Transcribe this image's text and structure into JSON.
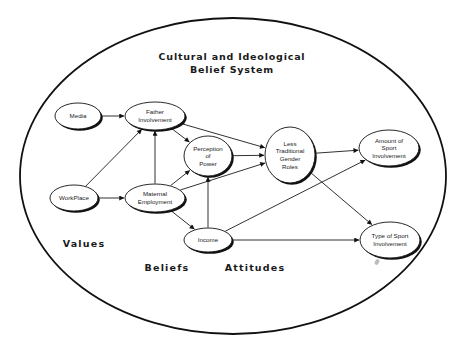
{
  "diagram": {
    "title_line1": "Cultural  and  Ideological",
    "title_line2": "Belief  System",
    "regions": {
      "values": "Values",
      "beliefs": "Beliefs",
      "attitudes": "Attitudes"
    },
    "boundary": {
      "cx": 233,
      "cy": 176,
      "rx": 213,
      "ry": 158
    },
    "nodes": [
      {
        "id": "media",
        "lines": [
          "Media"
        ],
        "cx": 78,
        "cy": 116,
        "rx": 23,
        "ry": 13
      },
      {
        "id": "workplace",
        "lines": [
          "WorkPlace"
        ],
        "cx": 74,
        "cy": 198,
        "rx": 24,
        "ry": 13
      },
      {
        "id": "father",
        "lines": [
          "Father",
          "Involvement"
        ],
        "cx": 155,
        "cy": 116,
        "rx": 30,
        "ry": 14
      },
      {
        "id": "maternal",
        "lines": [
          "Maternal",
          "Employment"
        ],
        "cx": 155,
        "cy": 198,
        "rx": 30,
        "ry": 14
      },
      {
        "id": "perception",
        "lines": [
          "Perception",
          "of",
          "Power"
        ],
        "cx": 208,
        "cy": 156,
        "rx": 24,
        "ry": 20
      },
      {
        "id": "income",
        "lines": [
          "Income"
        ],
        "cx": 208,
        "cy": 240,
        "rx": 24,
        "ry": 12
      },
      {
        "id": "lesstrad",
        "lines": [
          "Less",
          "Traditional",
          "Gender",
          "Roles"
        ],
        "cx": 290,
        "cy": 155,
        "rx": 25,
        "ry": 28
      },
      {
        "id": "amount",
        "lines": [
          "Amount of",
          "Sport",
          "Involvement"
        ],
        "cx": 389,
        "cy": 148,
        "rx": 30,
        "ry": 18
      },
      {
        "id": "type",
        "lines": [
          "Type of Sport",
          "Involvement"
        ],
        "cx": 390,
        "cy": 240,
        "rx": 30,
        "ry": 18
      }
    ],
    "edges": [
      {
        "from": "media",
        "to": "father"
      },
      {
        "from": "workplace",
        "to": "father"
      },
      {
        "from": "workplace",
        "to": "maternal"
      },
      {
        "from": "maternal",
        "to": "father"
      },
      {
        "from": "father",
        "to": "perception"
      },
      {
        "from": "father",
        "to": "lesstrad"
      },
      {
        "from": "maternal",
        "to": "perception"
      },
      {
        "from": "maternal",
        "to": "lesstrad"
      },
      {
        "from": "maternal",
        "to": "income"
      },
      {
        "from": "income",
        "to": "perception"
      },
      {
        "from": "perception",
        "to": "lesstrad"
      },
      {
        "from": "lesstrad",
        "to": "amount"
      },
      {
        "from": "lesstrad",
        "to": "type"
      },
      {
        "from": "income",
        "to": "amount"
      },
      {
        "from": "income",
        "to": "type"
      }
    ],
    "colors": {
      "line": "#111111",
      "background": "#ffffff",
      "smudge": "#bbbbbb"
    }
  }
}
